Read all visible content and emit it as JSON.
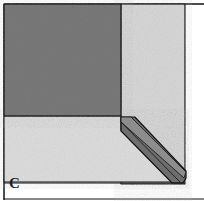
{
  "figure": {
    "label": "C",
    "colors": {
      "dark_square": "#7a7a7a",
      "light_panel": "#d6d6d6",
      "bottom_panel": "#dcdcdc",
      "strip_dark": "#6e6e6e",
      "strip_light": "#8a8a8a",
      "outline": "#111111"
    }
  }
}
